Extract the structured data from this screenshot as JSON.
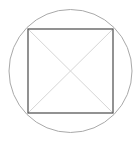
{
  "canvas": {
    "width": 139,
    "height": 142,
    "background_color": "#ffffff",
    "title": "Square inscribed in a circle with diagonals"
  },
  "chart_data": {
    "type": "diagram",
    "shapes": [
      {
        "name": "circumscribed-circle",
        "kind": "circle",
        "center": [
          70.5,
          71.0
        ],
        "radius": 61.5,
        "stroke": "#a9a9a9",
        "stroke_width": 1.0,
        "fill": "none"
      },
      {
        "name": "inscribed-square",
        "kind": "square",
        "corners": [
          [
            28,
            29
          ],
          [
            113,
            29
          ],
          [
            113,
            113
          ],
          [
            28,
            113
          ]
        ],
        "side_length": 85,
        "stroke": "#585858",
        "stroke_width": 1.3,
        "fill": "none"
      },
      {
        "name": "diagonal-top-left-to-bottom-right",
        "kind": "line",
        "from": [
          28,
          29
        ],
        "to": [
          113,
          113
        ],
        "stroke": "#d6d6d6",
        "stroke_width": 1.0
      },
      {
        "name": "diagonal-top-right-to-bottom-left",
        "kind": "line",
        "from": [
          113,
          29
        ],
        "to": [
          28,
          113
        ],
        "stroke": "#d6d6d6",
        "stroke_width": 1.0
      }
    ],
    "center_point": [
      70.5,
      71.0
    ],
    "axis": "off",
    "grid": false,
    "legend": false,
    "labels": []
  },
  "colors": {
    "circle_stroke": "#a9a9a9",
    "square_stroke": "#585858",
    "diagonal_stroke": "#d6d6d6",
    "background": "#ffffff"
  }
}
